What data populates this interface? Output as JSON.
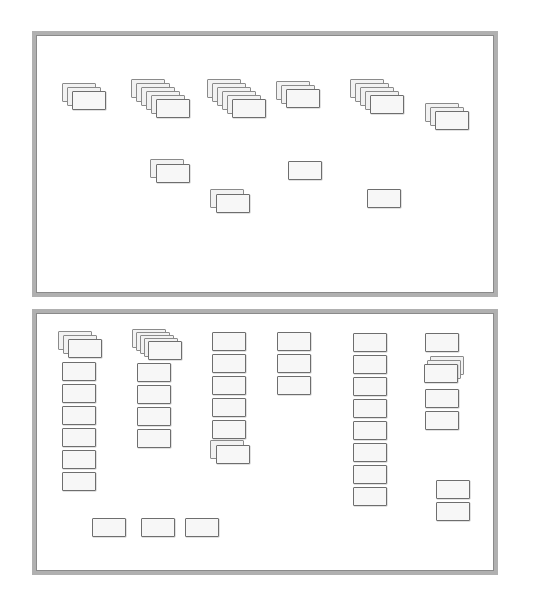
{
  "document": {
    "kind": "scanned-diagram",
    "title": "",
    "background_color": "#ffffff",
    "frame_color": "#b0b0b0",
    "card_fill": "#f2f2f2",
    "card_border": "#8a8a8a",
    "width": 533,
    "height": 615
  },
  "panels": [
    {
      "id": "panel-top",
      "name": "upper-panel",
      "x": 32,
      "y": 31,
      "width": 466,
      "height": 266,
      "groups": [
        {
          "id": "t-g1",
          "x": 30,
          "y": 52,
          "count": 3,
          "label": ""
        },
        {
          "id": "t-g2",
          "x": 99,
          "y": 48,
          "count": 6,
          "label": ""
        },
        {
          "id": "t-g3",
          "x": 175,
          "y": 48,
          "count": 6,
          "label": ""
        },
        {
          "id": "t-g4",
          "x": 244,
          "y": 50,
          "count": 3,
          "label": ""
        },
        {
          "id": "t-g5",
          "x": 318,
          "y": 48,
          "count": 5,
          "label": ""
        },
        {
          "id": "t-g6",
          "x": 393,
          "y": 72,
          "count": 3,
          "label": ""
        },
        {
          "id": "t-g7",
          "x": 118,
          "y": 128,
          "count": 2,
          "label": ""
        },
        {
          "id": "t-g8",
          "x": 178,
          "y": 158,
          "count": 2,
          "label": ""
        },
        {
          "id": "t-g9",
          "x": 256,
          "y": 130,
          "count": 1,
          "label": ""
        },
        {
          "id": "t-g10",
          "x": 335,
          "y": 158,
          "count": 1,
          "label": ""
        }
      ]
    },
    {
      "id": "panel-bottom",
      "name": "lower-panel",
      "x": 32,
      "y": 309,
      "width": 466,
      "height": 266,
      "groups": [
        {
          "id": "b-c1-s",
          "x": 26,
          "y": 22,
          "count": 3,
          "label": ""
        },
        {
          "id": "b-c2-s",
          "x": 98,
          "y": 20,
          "count": 5,
          "label": ""
        },
        {
          "id": "b-c3-s",
          "x": 175,
          "y": 113,
          "count": 2,
          "label": ""
        },
        {
          "id": "b-c6-s",
          "x": 390,
          "y": 36,
          "count": 3,
          "label": ""
        }
      ],
      "columns": [
        {
          "id": "b-col1",
          "x": 30,
          "y": 49,
          "count": 6,
          "label": ""
        },
        {
          "id": "b-col2",
          "x": 101,
          "y": 50,
          "count": 4,
          "label": ""
        },
        {
          "id": "b-col3",
          "x": 178,
          "y": 21,
          "count": 5,
          "label": ""
        },
        {
          "id": "b-col4",
          "x": 244,
          "y": 21,
          "count": 3,
          "label": ""
        },
        {
          "id": "b-col5",
          "x": 320,
          "y": 22,
          "count": 8,
          "label": ""
        },
        {
          "id": "b-col6",
          "x": 392,
          "y": 22,
          "count": 1,
          "label": ""
        },
        {
          "id": "b-col6b",
          "x": 392,
          "y": 66,
          "count": 2,
          "label": ""
        },
        {
          "id": "b-col6c",
          "x": 396,
          "y": 163,
          "count": 2,
          "label": ""
        }
      ],
      "bottom_row": [
        {
          "id": "b-r1",
          "x": 57,
          "y": 204,
          "count": 1,
          "label": ""
        },
        {
          "id": "b-r2",
          "x": 105,
          "y": 204,
          "count": 1,
          "label": ""
        },
        {
          "id": "b-r3",
          "x": 148,
          "y": 204,
          "count": 1,
          "label": ""
        }
      ]
    }
  ]
}
